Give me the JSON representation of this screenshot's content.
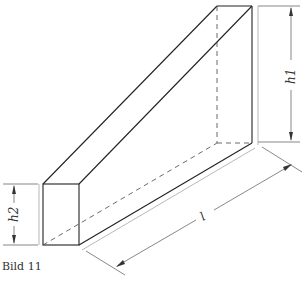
{
  "figure": {
    "caption": "Bild 11",
    "labels": {
      "h1": "h1",
      "h2": "h2",
      "l": "l"
    },
    "colors": {
      "edge": "#222222",
      "dim": "#555555",
      "hidden": "#444444"
    }
  }
}
